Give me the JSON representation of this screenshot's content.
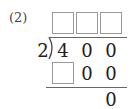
{
  "problem": {
    "label": "(2)",
    "divisor": "2",
    "dividend_digits": [
      "4",
      "0",
      "0"
    ],
    "quotient_boxes": [
      "",
      "",
      ""
    ],
    "step1": {
      "box": "",
      "digits": [
        "0",
        "0"
      ]
    },
    "remainder": "0"
  },
  "colors": {
    "box_border": "#999999",
    "line": "#666666",
    "text": "#222222"
  }
}
